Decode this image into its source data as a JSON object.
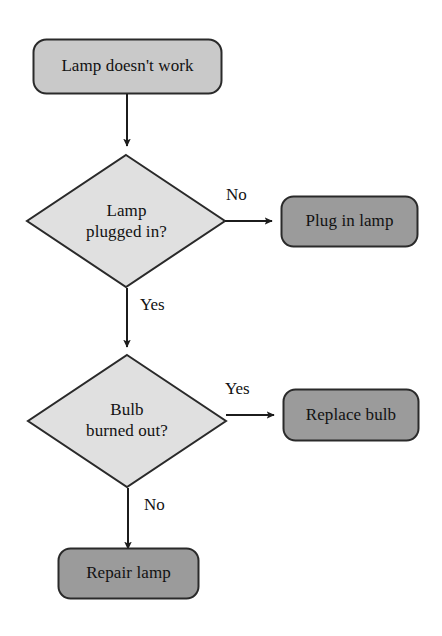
{
  "diagram": {
    "type": "flowchart",
    "background_color": "#ffffff",
    "palette": {
      "terminal_fill": "#c9c9c9",
      "decision_fill": "#e0e0e0",
      "action_fill": "#9b9b9b",
      "stroke": "#2a2a2a",
      "text": "#121212"
    },
    "nodes": [
      {
        "id": "start",
        "shape": "rounded-rect",
        "label": "Lamp doesn't work",
        "fill": "#c9c9c9"
      },
      {
        "id": "decision-plugged",
        "shape": "diamond",
        "label": "Lamp\nplugged in?",
        "fill": "#e0e0e0"
      },
      {
        "id": "action-plug",
        "shape": "rounded-rect",
        "label": "Plug in lamp",
        "fill": "#9b9b9b"
      },
      {
        "id": "decision-bulb",
        "shape": "diamond",
        "label": "Bulb\nburned out?",
        "fill": "#e0e0e0"
      },
      {
        "id": "action-replace",
        "shape": "rounded-rect",
        "label": "Replace bulb",
        "fill": "#9b9b9b"
      },
      {
        "id": "action-repair",
        "shape": "rounded-rect",
        "label": "Repair lamp",
        "fill": "#9b9b9b"
      }
    ],
    "edges": [
      {
        "id": "e1",
        "from": "start",
        "to": "decision-plugged",
        "label": ""
      },
      {
        "id": "e2",
        "from": "decision-plugged",
        "to": "action-plug",
        "label": "No"
      },
      {
        "id": "e3",
        "from": "decision-plugged",
        "to": "decision-bulb",
        "label": "Yes"
      },
      {
        "id": "e4",
        "from": "decision-bulb",
        "to": "action-replace",
        "label": "Yes"
      },
      {
        "id": "e5",
        "from": "decision-bulb",
        "to": "action-repair",
        "label": "No"
      }
    ]
  }
}
